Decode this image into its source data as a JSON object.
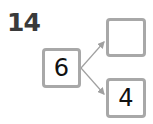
{
  "question": {
    "number": "14"
  },
  "number_bond": {
    "whole": "6",
    "parts": [
      {
        "value": ""
      },
      {
        "value": "4"
      }
    ]
  },
  "colors": {
    "box_border": "#a8a8a8",
    "arrow": "#a0a0a0",
    "number_text": "#3a3a3a"
  }
}
